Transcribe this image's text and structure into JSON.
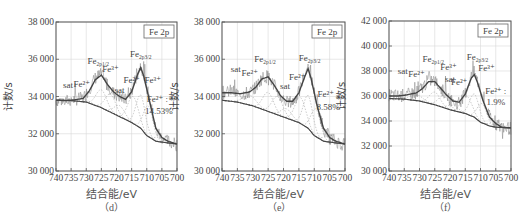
{
  "figure": {
    "caption_partial": "",
    "panels_count": 3
  },
  "chart_data": [
    {
      "type": "line",
      "panel": "(d)",
      "title": "",
      "box_label": "Fe 2p",
      "xlabel": "结合能/eV",
      "ylabel": "计数/s",
      "xlim": [
        740,
        700
      ],
      "x_reversed": true,
      "xticks": [
        740,
        735,
        730,
        725,
        720,
        715,
        710,
        705,
        700
      ],
      "ylim": [
        30000,
        38000
      ],
      "yticks": [
        30000,
        32000,
        34000,
        36000,
        38000
      ],
      "ytick_labels": [
        "30 000",
        "32 000",
        "34 000",
        "36 000",
        "38 000"
      ],
      "grid": true,
      "series": [
        {
          "name": "raw",
          "x": [
            740,
            737,
            734,
            731,
            729,
            727,
            725,
            723,
            721,
            719,
            717,
            715,
            713,
            712,
            711,
            709,
            707,
            705,
            703,
            700
          ],
          "y": [
            33800,
            33750,
            33850,
            33900,
            34400,
            35000,
            35200,
            34600,
            34200,
            34000,
            33800,
            34300,
            35300,
            35700,
            35200,
            33800,
            32200,
            31800,
            31600,
            31400
          ]
        },
        {
          "name": "fit",
          "x": [
            740,
            737,
            734,
            731,
            729,
            727,
            725,
            723,
            721,
            719,
            717,
            715,
            713,
            712,
            711,
            709,
            707,
            705,
            703,
            700
          ],
          "y": [
            33800,
            33780,
            33820,
            33900,
            34300,
            34900,
            35150,
            34650,
            34250,
            34000,
            33850,
            34250,
            35200,
            35550,
            35100,
            33700,
            32300,
            31800,
            31600,
            31450
          ]
        },
        {
          "name": "background",
          "x": [
            740,
            735,
            730,
            725,
            720,
            715,
            712,
            710,
            707,
            705,
            700
          ],
          "y": [
            33800,
            33780,
            33700,
            33400,
            33000,
            32600,
            32300,
            31900,
            31600,
            31550,
            31450
          ]
        }
      ],
      "annotations": [
        {
          "text": "sat",
          "x": 736,
          "y": 34450
        },
        {
          "text": "Fe²⁺",
          "x": 731.5,
          "y": 34500
        },
        {
          "text": "Fe2p1/2",
          "x": 726,
          "y": 35750
        },
        {
          "text": "Fe³⁺",
          "x": 722,
          "y": 35300
        },
        {
          "text": "sat",
          "x": 719,
          "y": 34200
        },
        {
          "text": "Fe²⁺",
          "x": 715,
          "y": 34700
        },
        {
          "text": "Fe2p3/2",
          "x": 712,
          "y": 36100
        },
        {
          "text": "Fe³⁺",
          "x": 708,
          "y": 34700
        },
        {
          "text": "Fe²⁺ :",
          "x": 706.5,
          "y": 33700
        },
        {
          "text": "14.53%",
          "x": 706,
          "y": 33050
        }
      ]
    },
    {
      "type": "line",
      "panel": "(e)",
      "title": "",
      "box_label": "Fe 2p",
      "xlabel": "结合能/eV",
      "ylabel": "计数/s",
      "xlim": [
        740,
        700
      ],
      "x_reversed": true,
      "xticks": [
        740,
        735,
        730,
        725,
        720,
        715,
        710,
        705,
        700
      ],
      "ylim": [
        30000,
        38000
      ],
      "yticks": [
        30000,
        32000,
        34000,
        36000,
        38000
      ],
      "ytick_labels": [
        "30 000",
        "32 000",
        "34 000",
        "36 000",
        "38 000"
      ],
      "grid": true,
      "series": [
        {
          "name": "raw",
          "x": [
            740,
            737,
            734,
            731,
            729,
            727,
            725,
            723,
            721,
            719,
            717,
            715,
            713,
            712,
            711,
            709,
            707,
            705,
            703,
            700
          ],
          "y": [
            34200,
            34300,
            34100,
            34200,
            34500,
            35000,
            35100,
            34600,
            34000,
            33700,
            33700,
            34200,
            35200,
            35700,
            35000,
            33500,
            32300,
            31800,
            31600,
            31400
          ]
        },
        {
          "name": "fit",
          "x": [
            740,
            737,
            734,
            731,
            729,
            727,
            725,
            723,
            721,
            719,
            717,
            715,
            713,
            712,
            711,
            709,
            707,
            705,
            703,
            700
          ],
          "y": [
            34200,
            34200,
            34150,
            34250,
            34500,
            34950,
            35050,
            34600,
            34050,
            33750,
            33750,
            34200,
            35100,
            35500,
            34950,
            33450,
            32300,
            31800,
            31600,
            31450
          ]
        },
        {
          "name": "background",
          "x": [
            740,
            735,
            730,
            725,
            720,
            715,
            712,
            710,
            707,
            705,
            700
          ],
          "y": [
            33800,
            33700,
            33500,
            33200,
            32900,
            32600,
            32300,
            31900,
            31600,
            31550,
            31450
          ]
        }
      ],
      "annotations": [
        {
          "text": "sat",
          "x": 735.5,
          "y": 35300
        },
        {
          "text": "Fe²⁺",
          "x": 731,
          "y": 35100
        },
        {
          "text": "Fe2p1/2",
          "x": 726,
          "y": 35850
        },
        {
          "text": "sat",
          "x": 719.5,
          "y": 34400
        },
        {
          "text": "Fe²⁺",
          "x": 715.5,
          "y": 34900
        },
        {
          "text": "Fe2p3/2",
          "x": 711.5,
          "y": 35900
        },
        {
          "text": "Fe²⁺ :",
          "x": 705.5,
          "y": 34000
        },
        {
          "text": "8.58%",
          "x": 705.5,
          "y": 33300
        }
      ]
    },
    {
      "type": "line",
      "panel": "(f)",
      "title": "",
      "box_label": "Fe 2p",
      "xlabel": "结合能/eV",
      "ylabel": "计数/s",
      "xlim": [
        740,
        700
      ],
      "x_reversed": true,
      "xticks": [
        740,
        735,
        730,
        725,
        720,
        715,
        710,
        705,
        700
      ],
      "ylim": [
        30000,
        42000
      ],
      "yticks": [
        30000,
        32000,
        34000,
        36000,
        38000,
        40000,
        42000
      ],
      "ytick_labels": [
        "30 000",
        "32 000",
        "34 000",
        "36 000",
        "38 000",
        "40 000",
        "42 000"
      ],
      "grid": true,
      "series": [
        {
          "name": "raw",
          "x": [
            740,
            737,
            734,
            731,
            729,
            727,
            725,
            723,
            721,
            719,
            717,
            715,
            713,
            712,
            711,
            709,
            707,
            705,
            703,
            700
          ],
          "y": [
            36100,
            36000,
            36100,
            36300,
            36700,
            37300,
            37200,
            36600,
            36000,
            35500,
            35400,
            36200,
            37600,
            37900,
            37200,
            35600,
            34300,
            33800,
            33500,
            33400
          ]
        },
        {
          "name": "fit",
          "x": [
            740,
            737,
            734,
            731,
            729,
            727,
            725,
            723,
            721,
            719,
            717,
            715,
            713,
            712,
            711,
            709,
            707,
            705,
            703,
            700
          ],
          "y": [
            36000,
            36000,
            36100,
            36250,
            36600,
            37150,
            37150,
            36600,
            36050,
            35600,
            35500,
            36150,
            37450,
            37700,
            37100,
            35500,
            34300,
            33800,
            33500,
            33450
          ]
        },
        {
          "name": "background",
          "x": [
            740,
            735,
            730,
            725,
            720,
            715,
            712,
            710,
            707,
            705,
            700
          ],
          "y": [
            35800,
            35750,
            35600,
            35300,
            34900,
            34600,
            34300,
            33900,
            33600,
            33500,
            33450
          ]
        }
      ],
      "annotations": [
        {
          "text": "sat",
          "x": 735.5,
          "y": 37800
        },
        {
          "text": "Fe²⁺",
          "x": 731,
          "y": 37550
        },
        {
          "text": "Fe2p1/2",
          "x": 725.5,
          "y": 38700
        },
        {
          "text": "Fe³⁺",
          "x": 720.5,
          "y": 38100
        },
        {
          "text": "sat",
          "x": 720,
          "y": 37100
        },
        {
          "text": "Fe²⁺",
          "x": 717,
          "y": 36900
        },
        {
          "text": "Fe2p3/2",
          "x": 711,
          "y": 38900
        },
        {
          "text": "Fe³⁺",
          "x": 708,
          "y": 38000
        },
        {
          "text": "Fe²⁺ :",
          "x": 705,
          "y": 36200
        },
        {
          "text": "1.9%",
          "x": 705,
          "y": 35300
        }
      ]
    }
  ],
  "panels": [
    {
      "id": "d",
      "box_label": "Fe 2p",
      "xlabel": "结合能/eV",
      "ylabel": "计数/s",
      "sublabel": "（d）",
      "percent": "14.53%"
    },
    {
      "id": "e",
      "box_label": "Fe 2p",
      "xlabel": "结合能/eV",
      "ylabel": "计数/s",
      "sublabel": "（e）",
      "percent": "8.58%"
    },
    {
      "id": "f",
      "box_label": "Fe 2p",
      "xlabel": "结合能/eV",
      "ylabel": "计数/s",
      "sublabel": "（f）",
      "percent": "1.9%"
    }
  ],
  "layout": {
    "frames": [
      {
        "left": 56,
        "top": 22,
        "right": 177,
        "bottom": 171
      },
      {
        "left": 222,
        "top": 22,
        "right": 345,
        "bottom": 171
      },
      {
        "left": 389,
        "top": 21,
        "right": 511,
        "bottom": 171
      }
    ]
  }
}
